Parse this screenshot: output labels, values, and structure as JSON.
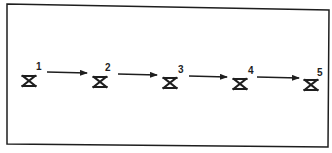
{
  "diagram": {
    "type": "sequence",
    "colors": {
      "stroke": "#1e1e1e",
      "background": "#ffffff"
    },
    "frame": {
      "corners": [
        [
          7,
          4
        ],
        [
          329,
          10
        ],
        [
          328,
          147
        ],
        [
          7,
          144
        ]
      ]
    },
    "nodes": [
      {
        "id": 1,
        "label": "1",
        "symbol": "hourglass-x-triangle",
        "cx": 29,
        "cy": 81,
        "label_x": 36,
        "label_y": 70
      },
      {
        "id": 2,
        "label": "2",
        "symbol": "hourglass-x-triangle",
        "cx": 100,
        "cy": 82,
        "label_x": 105,
        "label_y": 71
      },
      {
        "id": 3,
        "label": "3",
        "symbol": "hourglass-x-triangle",
        "cx": 170,
        "cy": 83,
        "label_x": 178,
        "label_y": 73
      },
      {
        "id": 4,
        "label": "4",
        "symbol": "hourglass-x-triangle",
        "cx": 240,
        "cy": 84,
        "label_x": 248,
        "label_y": 74
      },
      {
        "id": 5,
        "label": "5",
        "symbol": "hourglass-x-triangle",
        "cx": 311,
        "cy": 85,
        "label_x": 317,
        "label_y": 76
      }
    ],
    "edges": [
      {
        "from": 1,
        "to": 2,
        "x1": 47,
        "y1": 72,
        "x2": 87,
        "y2": 73
      },
      {
        "from": 2,
        "to": 3,
        "x1": 118,
        "y1": 74,
        "x2": 157,
        "y2": 75
      },
      {
        "from": 3,
        "to": 4,
        "x1": 189,
        "y1": 76,
        "x2": 227,
        "y2": 77
      },
      {
        "from": 4,
        "to": 5,
        "x1": 257,
        "y1": 77,
        "x2": 299,
        "y2": 78
      }
    ]
  }
}
